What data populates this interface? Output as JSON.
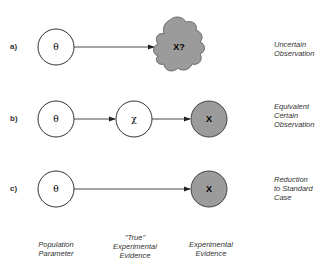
{
  "rows": [
    {
      "label": "a)",
      "note": "Uncertain\nObservation",
      "nodes": [
        "θ",
        "X?"
      ]
    },
    {
      "label": "b)",
      "note": "Equivalent\nCertain\nObservation",
      "nodes": [
        "θ",
        "χ",
        "X"
      ]
    },
    {
      "label": "c)",
      "note": "Reduction\nto Standard\nCase",
      "nodes": [
        "θ",
        "X"
      ]
    }
  ],
  "bottom_labels": [
    "Population\nParameter",
    "\"True\"\nExperimental\nEvidence",
    "Experimental\nEvidence"
  ],
  "colors": {
    "observed_fill": "#9b9b9b",
    "stroke": "#333333"
  }
}
